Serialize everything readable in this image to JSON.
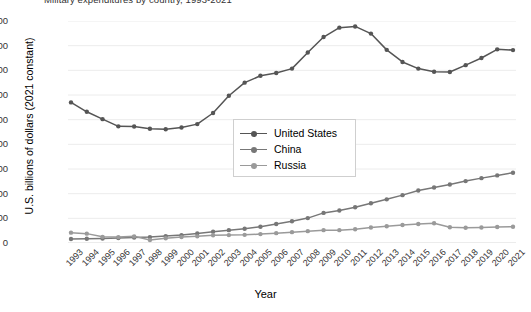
{
  "title": "Military expenditures by country, 1993-2021",
  "axis": {
    "x_title": "Year",
    "y_title": "U.S. billions of dollars (2021 constant)"
  },
  "legend": {
    "items": [
      {
        "label": "United States",
        "color": "#555555"
      },
      {
        "label": "China",
        "color": "#777777"
      },
      {
        "label": "Russia",
        "color": "#9a9a9a"
      }
    ]
  },
  "chart_data": {
    "type": "line",
    "title": "Military expenditures by country, 1993-2021",
    "xlabel": "Year",
    "ylabel": "U.S. billions of dollars (2021 constant)",
    "ylim": [
      0,
      900
    ],
    "ytick_step": 100,
    "yticks": [
      0,
      100,
      200,
      300,
      400,
      500,
      600,
      700,
      800,
      900
    ],
    "grid": true,
    "legend_position": "center",
    "categories": [
      "1993",
      "1994",
      "1995",
      "1996",
      "1997",
      "1998",
      "1999",
      "2000",
      "2001",
      "2002",
      "2003",
      "2004",
      "2005",
      "2006",
      "2007",
      "2008",
      "2009",
      "2010",
      "2011",
      "2012",
      "2013",
      "2014",
      "2015",
      "2016",
      "2017",
      "2018",
      "2019",
      "2020",
      "2021"
    ],
    "series": [
      {
        "name": "United States",
        "color": "#555555",
        "values": [
          570,
          532,
          502,
          473,
          472,
          463,
          461,
          468,
          482,
          527,
          597,
          650,
          678,
          689,
          707,
          772,
          835,
          873,
          878,
          849,
          783,
          734,
          707,
          694,
          693,
          721,
          750,
          785,
          782
        ]
      },
      {
        "name": "China",
        "color": "#777777",
        "values": [
          16,
          17,
          18,
          20,
          22,
          24,
          28,
          32,
          39,
          46,
          52,
          58,
          66,
          77,
          88,
          101,
          122,
          132,
          145,
          161,
          177,
          194,
          213,
          225,
          237,
          251,
          263,
          274,
          285
        ]
      },
      {
        "name": "Russia",
        "color": "#9a9a9a",
        "values": [
          42,
          38,
          25,
          24,
          27,
          12,
          19,
          24,
          27,
          31,
          32,
          33,
          36,
          40,
          44,
          48,
          52,
          52,
          56,
          63,
          68,
          73,
          77,
          80,
          64,
          62,
          63,
          65,
          66
        ]
      }
    ]
  }
}
